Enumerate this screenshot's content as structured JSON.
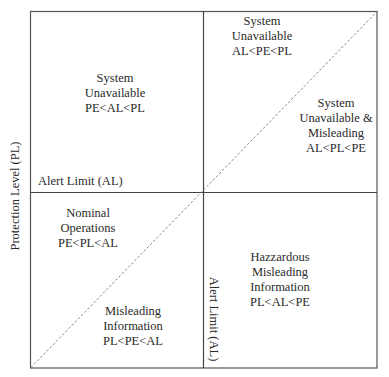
{
  "diagram": {
    "type": "integrity-quadrant-diagram",
    "axes": {
      "y_label": "Protection Level (PL)",
      "al_horizontal_label": "Alert Limit (AL)",
      "al_vertical_label": "Alert Limit (AL)"
    },
    "regions": [
      {
        "id": "top-left",
        "lines": [
          "System",
          "Unavailable",
          "PE<AL<PL"
        ]
      },
      {
        "id": "top-right-upper",
        "lines": [
          "System",
          "Unavailable",
          "AL<PE<PL"
        ]
      },
      {
        "id": "top-right-lower",
        "lines": [
          "System",
          "Unavailable &",
          "Misleading",
          "AL<PL<PE"
        ]
      },
      {
        "id": "bottom-left-upper",
        "lines": [
          "Nominal",
          "Operations",
          "PE<PL<AL"
        ]
      },
      {
        "id": "bottom-left-lower",
        "lines": [
          "Misleading",
          "Information",
          "PL<PE<AL"
        ]
      },
      {
        "id": "bottom-right",
        "lines": [
          "Hazzardous",
          "Misleading",
          "Information",
          "PL<AL<PE"
        ]
      }
    ],
    "colors": {
      "border": "#555555",
      "divider": "#444444",
      "diagonal": "#777777",
      "text": "#2a2a2a"
    }
  }
}
